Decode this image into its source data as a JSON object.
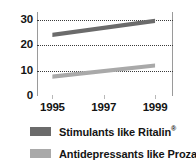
{
  "chart_data": {
    "type": "line",
    "title": "",
    "subtitle": "",
    "xlabel": "",
    "ylabel": "",
    "x": [
      1995,
      1997,
      1999
    ],
    "xtick_labels": [
      "1995",
      "1997",
      "1999"
    ],
    "ytick_labels": [
      "0",
      "10",
      "20",
      "30"
    ],
    "yticks": [
      0,
      10,
      20,
      30
    ],
    "ylim": [
      0,
      33
    ],
    "xlim": [
      1994.4,
      1999.7
    ],
    "grid": "horizontal-dotted",
    "legend_position": "below",
    "series": [
      {
        "name": "Stimulants like Ritalin®",
        "label_text": "Stimulants like Ritalin",
        "label_superscript": "®",
        "color": "#6b6b6b",
        "x": [
          1995,
          1999
        ],
        "values": [
          24,
          29.5
        ],
        "band_thickness": 1.6
      },
      {
        "name": "Antidepressants like Prozac®",
        "label_text": "Antidepressants like Prozac",
        "label_superscript": "®",
        "color": "#a9a9a9",
        "x": [
          1995,
          1999
        ],
        "values": [
          7.6,
          12.0
        ],
        "band_thickness": 1.6
      }
    ]
  },
  "axes": {
    "y_ticks": [
      {
        "value": 30,
        "label": "30"
      },
      {
        "value": 20,
        "label": "20"
      },
      {
        "value": 10,
        "label": "10"
      },
      {
        "value": 0,
        "label": "0"
      }
    ],
    "x_ticks": [
      {
        "value": 1995,
        "label": "1995"
      },
      {
        "value": 1997,
        "label": "1997"
      },
      {
        "value": 1999,
        "label": "1999"
      }
    ]
  },
  "legend": {
    "items": [
      {
        "label": "Stimulants like Ritalin",
        "mark": "®",
        "color": "#6b6b6b"
      },
      {
        "label": "Antidepressants like Prozac",
        "mark": "®",
        "color": "#a9a9a9"
      }
    ]
  },
  "colors": {
    "stimulants": "#6b6b6b",
    "antidepressants": "#a9a9a9",
    "gridline": "#3a3a3a",
    "frame": "#9a9a9a",
    "text": "#141414",
    "background": "#ffffff"
  }
}
